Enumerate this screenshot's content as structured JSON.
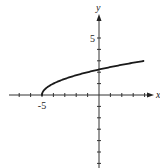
{
  "chart_data": {
    "type": "line",
    "title": "",
    "function": "y = sqrt(x + 5)",
    "xlabel": "x",
    "ylabel": "y",
    "xlim": [
      -8,
      4.5
    ],
    "ylim": [
      -6.5,
      7
    ],
    "x_tick_step": 1,
    "y_tick_step": 1,
    "labeled_ticks": {
      "x": [
        {
          "value": -5,
          "label": "-5"
        }
      ],
      "y": [
        {
          "value": 5,
          "label": "5"
        }
      ]
    },
    "grid": false,
    "series": [
      {
        "name": "f(x)",
        "x": [
          -5,
          -4.75,
          -4.5,
          -4,
          -3,
          -2,
          -1,
          0,
          1,
          2,
          3,
          4
        ],
        "values": [
          0,
          0.5,
          0.707,
          1,
          1.414,
          1.732,
          2,
          2.236,
          2.449,
          2.646,
          2.828,
          3
        ]
      }
    ],
    "colors": {
      "curve": "#1a1a1a",
      "axes": "#333333"
    }
  },
  "labels": {
    "x_axis": "x",
    "y_axis": "y",
    "x_tick": "-5",
    "y_tick": "5"
  }
}
